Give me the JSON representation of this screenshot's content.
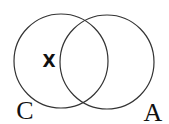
{
  "diagram": {
    "type": "venn",
    "sets": [
      {
        "label": "C",
        "cx": 61,
        "cy": 61,
        "r": 47
      },
      {
        "label": "A",
        "cx": 107,
        "cy": 62,
        "r": 47
      }
    ],
    "marker": {
      "label": "X",
      "region": "C only",
      "x": 49,
      "y": 67
    },
    "colors": {
      "stroke": "#333333",
      "text": "#111111",
      "background": "#ffffff"
    }
  }
}
